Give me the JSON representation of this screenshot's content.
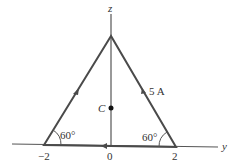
{
  "diagram": {
    "axes": {
      "vertical_label": "z",
      "horizontal_label": "y"
    },
    "ticks": {
      "left": "−2",
      "origin": "0",
      "right": "2"
    },
    "point_label": "C",
    "current_label": "5 A",
    "angles": {
      "left": "60°",
      "right": "60°"
    },
    "colors": {
      "line": "#4a4a4a",
      "axis": "#555555",
      "text": "#333333"
    }
  }
}
